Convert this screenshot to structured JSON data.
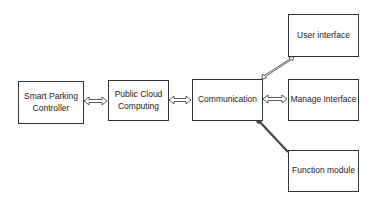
{
  "diagram": {
    "nodes": [
      {
        "id": "smart-parking-controller",
        "label": "Smart Parking Controller",
        "line1": "Smart Parking",
        "line2": "Controller"
      },
      {
        "id": "public-cloud-computing",
        "label": "Public Cloud Computing",
        "line1": "Public Cloud",
        "line2": "Computing"
      },
      {
        "id": "communication",
        "label": "Communication"
      },
      {
        "id": "user-interface",
        "label": "User interface"
      },
      {
        "id": "manage-interface",
        "label": "Manage Interface"
      },
      {
        "id": "function-module",
        "label": "Function module"
      }
    ],
    "edges": [
      {
        "from": "smart-parking-controller",
        "to": "public-cloud-computing",
        "type": "bidirectional-hollow-arrow"
      },
      {
        "from": "public-cloud-computing",
        "to": "communication",
        "type": "bidirectional-hollow-arrow"
      },
      {
        "from": "communication",
        "to": "user-interface",
        "type": "bidirectional-hollow-arrow"
      },
      {
        "from": "communication",
        "to": "manage-interface",
        "type": "bidirectional-hollow-arrow"
      },
      {
        "from": "communication",
        "to": "function-module",
        "type": "dark-connector"
      }
    ],
    "colors": {
      "border": "#333333",
      "arrow_dark": "#444444",
      "background": "#ffffff"
    }
  }
}
